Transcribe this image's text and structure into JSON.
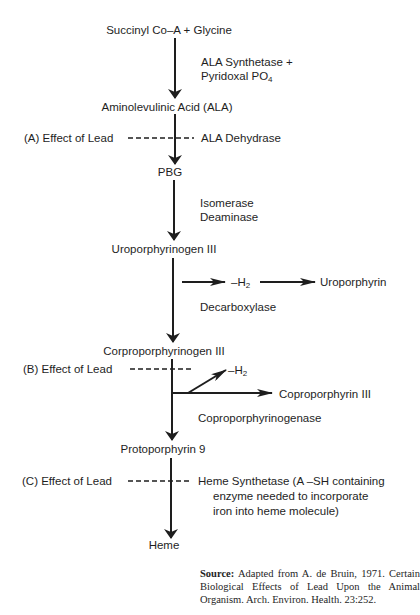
{
  "diagram": {
    "nodes": {
      "succinyl": "Succinyl Co–A  +  Glycine",
      "ala": "Aminolevulinic Acid (ALA)",
      "pbg": "PBG",
      "uro3": "Uroporphyrinogen III",
      "uroporphyrin": "Uroporphyrin",
      "copro3gen": "Corproporphyrinogen III",
      "copro3": "Coproporphyrin III",
      "proto9": "Protoporphyrin 9",
      "heme": "Heme"
    },
    "enzymes": {
      "ala_synthetase_1": "ALA Synthetase  +",
      "ala_synthetase_2": "Pyridoxal PO",
      "ala_synthetase_sub": "4",
      "ala_dehydrase": "ALA Dehydrase",
      "isomerase": "Isomerase",
      "deaminase": "Deaminase",
      "decarboxylase": "Decarboxylase",
      "coproporphyrinogenase": "Coproporphyrinogenase",
      "heme_synthetase_1": "Heme Synthetase (A –SH containing",
      "heme_synthetase_2": "enzyme needed to incorporate",
      "heme_synthetase_3": "iron into heme molecule)"
    },
    "byproducts": {
      "h2_a": "–H",
      "h2_b": "–H",
      "sub": "2"
    },
    "lead_effects": {
      "a": "(A)  Effect of Lead",
      "b": "(B)  Effect of Lead",
      "c": "(C)  Effect of Lead"
    },
    "source": {
      "label": "Source:",
      "text": " Adapted from A. de Bruin, 1971. Certain Biological Effects of Lead Upon the Animal Organism. Arch. Environ. Health. 23:252."
    },
    "colors": {
      "ink": "#1e1e1e",
      "background": "#ffffff"
    }
  }
}
